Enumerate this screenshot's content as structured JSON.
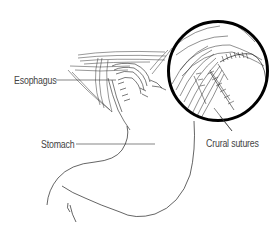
{
  "figure": {
    "type": "anatomical-illustration",
    "labels": {
      "esophagus": "Esophagus",
      "stomach": "Stomach",
      "crural_sutures": "Crural sutures"
    },
    "colors": {
      "line": "#222222",
      "label_text": "#444444",
      "magnifier_ring": "#000000",
      "background": "#ffffff"
    }
  }
}
